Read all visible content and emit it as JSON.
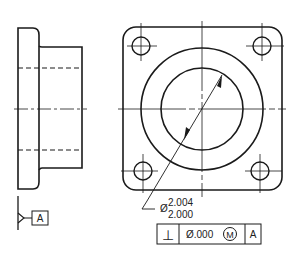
{
  "drawing": {
    "side_view": {
      "label": "side-view"
    },
    "front_view": {
      "label": "front-view"
    },
    "datum": {
      "letter": "A"
    },
    "diameter_dimension": {
      "symbol": "Ø",
      "upper_limit": "2.004",
      "lower_limit": "2.000"
    },
    "feature_control_frame": {
      "characteristic_symbol": "⊥",
      "tolerance": "Ø.000",
      "modifier": "M",
      "datum_reference": "A"
    }
  },
  "colors": {
    "line": "#1a1a1a",
    "background": "#ffffff"
  }
}
